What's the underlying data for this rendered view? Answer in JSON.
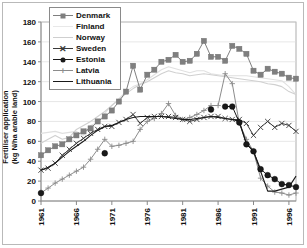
{
  "chart_data": {
    "type": "line",
    "title": "",
    "xlabel": "",
    "ylabel": "Fertiliser application",
    "ylabel_line2": "(kg N/ha arable land)",
    "ylim": [
      0,
      180
    ],
    "ytick_values": [
      0,
      20,
      40,
      60,
      80,
      100,
      120,
      140,
      160,
      180
    ],
    "xlim": [
      1961,
      1997
    ],
    "xtick_values": [
      1961,
      1966,
      1971,
      1976,
      1981,
      1986,
      1991,
      1996
    ],
    "xtick_labels": [
      "1961",
      "1966",
      "1971",
      "1976",
      "1981",
      "1986",
      "1991",
      "1996"
    ],
    "grid": true,
    "grid_axis": "y",
    "legend_position": "top-left-inside",
    "x": [
      1961,
      1962,
      1963,
      1964,
      1965,
      1966,
      1967,
      1968,
      1969,
      1970,
      1971,
      1972,
      1973,
      1974,
      1975,
      1976,
      1977,
      1978,
      1979,
      1980,
      1981,
      1982,
      1983,
      1984,
      1985,
      1986,
      1987,
      1988,
      1989,
      1990,
      1991,
      1992,
      1993,
      1994,
      1995,
      1996,
      1997
    ],
    "series": [
      {
        "name": "Denmark",
        "color": "#7f7f7f",
        "marker": "square",
        "marker_color": "#7f7f7f",
        "values": [
          46,
          51,
          55,
          57,
          62,
          66,
          70,
          73,
          80,
          85,
          91,
          100,
          110,
          136,
          112,
          127,
          132,
          140,
          142,
          147,
          140,
          141,
          148,
          161,
          145,
          145,
          141,
          156,
          153,
          148,
          131,
          127,
          133,
          130,
          128,
          124,
          123
        ]
      },
      {
        "name": "Finland",
        "color": "#e0e0e0",
        "marker": "none",
        "marker_color": "#e0e0e0",
        "values": [
          68,
          69,
          70,
          68,
          69,
          70,
          66,
          76,
          79,
          88,
          96,
          103,
          110,
          115,
          118,
          122,
          127,
          132,
          135,
          133,
          131,
          129,
          131,
          131,
          128,
          127,
          126,
          126,
          126,
          126,
          125,
          124,
          123,
          122,
          121,
          115,
          107
        ]
      },
      {
        "name": "Norway",
        "color": "#d0d0d0",
        "marker": "none",
        "marker_color": "#d0d0d0",
        "values": [
          58,
          62,
          66,
          62,
          64,
          72,
          76,
          80,
          85,
          90,
          96,
          102,
          108,
          113,
          117,
          120,
          124,
          128,
          131,
          129,
          128,
          126,
          127,
          128,
          127,
          126,
          125,
          124,
          123,
          122,
          121,
          120,
          118,
          117,
          115,
          110,
          107
        ]
      },
      {
        "name": "Sweden",
        "color": "#3a3a3a",
        "marker": "x",
        "marker_color": "#3a3a3a",
        "values": [
          31,
          33,
          38,
          46,
          52,
          58,
          63,
          68,
          72,
          75,
          75,
          79,
          82,
          87,
          78,
          84,
          85,
          85,
          85,
          84,
          82,
          80,
          82,
          84,
          85,
          85,
          83,
          82,
          82,
          78,
          66,
          74,
          80,
          74,
          78,
          76,
          70
        ]
      },
      {
        "name": "Estonia",
        "color": "#1a1a1a",
        "marker": "circle",
        "marker_color": "#1a1a1a",
        "values": [
          8,
          null,
          null,
          null,
          null,
          null,
          null,
          null,
          null,
          48,
          null,
          null,
          null,
          null,
          null,
          null,
          null,
          null,
          null,
          null,
          null,
          null,
          null,
          null,
          92,
          null,
          95,
          95,
          79,
          57,
          50,
          32,
          26,
          22,
          17,
          16,
          14
        ]
      },
      {
        "name": "Latvia",
        "color": "#8c8c8c",
        "marker": "plus",
        "marker_color": "#8c8c8c",
        "values": [
          8,
          13,
          18,
          22,
          26,
          30,
          34,
          42,
          52,
          62,
          55,
          56,
          58,
          60,
          72,
          80,
          83,
          88,
          98,
          86,
          82,
          84,
          87,
          91,
          96,
          96,
          128,
          118,
          78,
          62,
          50,
          23,
          15,
          9,
          8,
          6,
          8
        ]
      },
      {
        "name": "Lithuania",
        "color": "#1a1a1a",
        "marker": "none",
        "marker_color": "#1a1a1a",
        "values": [
          31,
          34,
          38,
          44,
          50,
          55,
          60,
          66,
          71,
          75,
          76,
          79,
          82,
          84,
          85,
          85,
          85,
          85,
          84,
          83,
          82,
          82,
          83,
          84,
          85,
          84,
          83,
          82,
          80,
          58,
          50,
          30,
          10,
          10,
          12,
          14,
          25
        ]
      }
    ]
  },
  "legend": {
    "items": [
      {
        "label": "Denmark",
        "marker": "square",
        "color": "#7f7f7f"
      },
      {
        "label": "Finland",
        "marker": "none",
        "color": "#e8e8e8"
      },
      {
        "label": "Norway",
        "marker": "none",
        "color": "#cfcfcf"
      },
      {
        "label": "Sweden",
        "marker": "x",
        "color": "#3a3a3a"
      },
      {
        "label": "Estonia",
        "marker": "circle",
        "color": "#1a1a1a"
      },
      {
        "label": "Latvia",
        "marker": "plus",
        "color": "#8c8c8c"
      },
      {
        "label": "Lithuania",
        "marker": "none",
        "color": "#1a1a1a"
      }
    ]
  }
}
